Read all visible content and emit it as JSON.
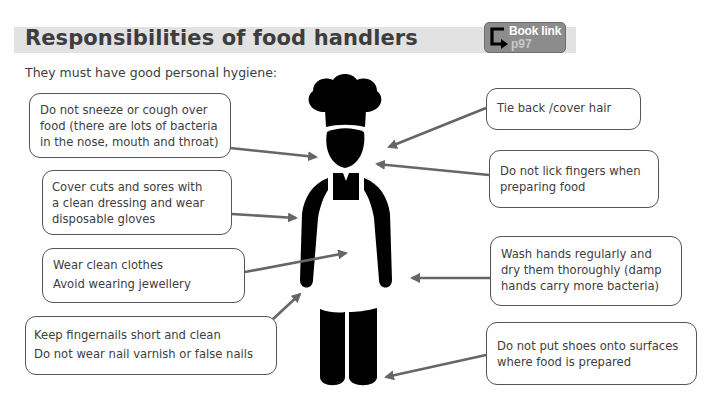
{
  "header": {
    "title": "Responsibilities of food handlers",
    "book_link": {
      "label": "Book link",
      "page": "p97",
      "icon": "return-arrow-icon"
    }
  },
  "subtitle": "They must have good personal hygiene:",
  "figure": {
    "icon": "chef-figure-icon"
  },
  "colors": {
    "title_bar": "#e2e2e2",
    "title_text": "#3d3d3d",
    "badge": "#8c8c8c",
    "arrow": "#666666",
    "box_border": "#555555",
    "figure": "#000000"
  },
  "left_boxes": [
    {
      "lines": [
        "Do not sneeze or cough over",
        "food (there are lots of bacteria",
        "in the nose, mouth and throat)"
      ]
    },
    {
      "lines": [
        "Cover cuts and sores with",
        "a clean dressing and wear",
        "disposable gloves"
      ]
    },
    {
      "lines": [
        "Wear clean clothes",
        "Avoid wearing jewellery"
      ]
    },
    {
      "lines": [
        "Keep fingernails short and clean",
        "Do not wear nail varnish or false nails"
      ]
    }
  ],
  "right_boxes": [
    {
      "lines": [
        "Tie back /cover hair"
      ]
    },
    {
      "lines": [
        "Do not lick fingers when",
        "preparing food"
      ]
    },
    {
      "lines": [
        "Wash hands regularly and",
        "dry them thoroughly (damp",
        "hands carry more bacteria)"
      ]
    },
    {
      "lines": [
        "Do not put shoes onto surfaces",
        "where food is prepared"
      ]
    }
  ]
}
